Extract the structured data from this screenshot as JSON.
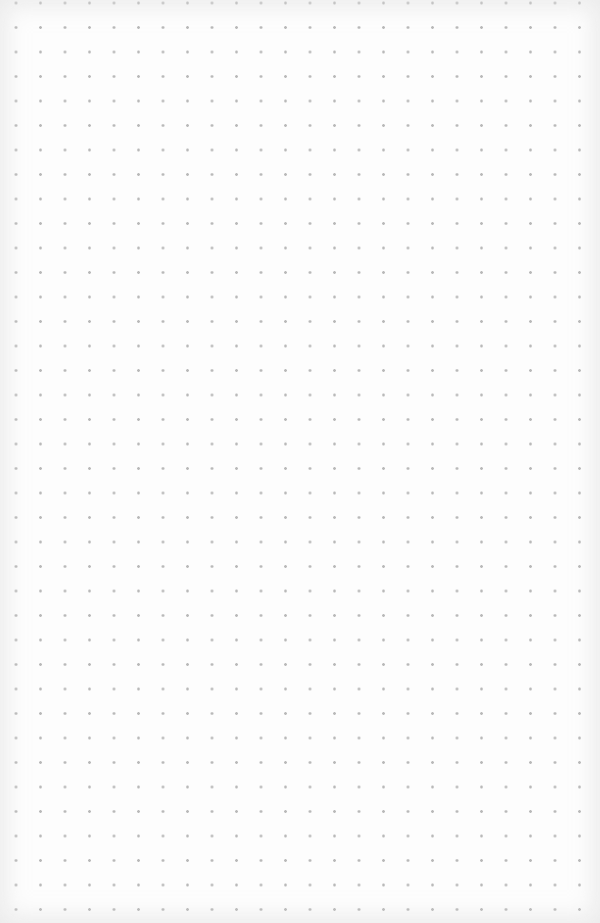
{
  "page": {
    "type": "dot-grid-paper",
    "background_color": "#fdfdfd",
    "dot_color": "#b9b9b9",
    "dot_spacing_px": 24.5,
    "columns": 24,
    "rows": 38
  }
}
